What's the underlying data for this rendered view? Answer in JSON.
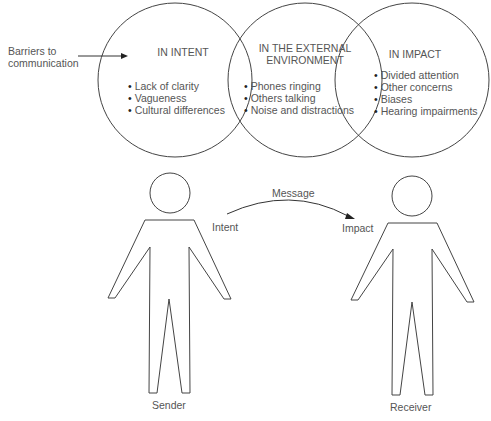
{
  "barriers_label": "Barriers to\ncommunication",
  "circles": [
    {
      "title": "IN INTENT",
      "items": [
        "Lack of clarity",
        "Vagueness",
        "Cultural differences"
      ]
    },
    {
      "title": "IN THE EXTERNAL ENVIRONMENT",
      "title_line1": "IN THE EXTERNAL",
      "title_line2": "ENVIRONMENT",
      "items": [
        "Phones ringing",
        "Others talking",
        "Noise and distractions"
      ]
    },
    {
      "title": "IN IMPACT",
      "items": [
        "Divided attention",
        "Other concerns",
        "Biases",
        "Hearing impairments"
      ]
    }
  ],
  "flow": {
    "message_label": "Message",
    "intent_label": "Intent",
    "impact_label": "Impact"
  },
  "figures": {
    "sender_label": "Sender",
    "receiver_label": "Receiver"
  },
  "colors": {
    "line": "#444444",
    "text": "#555555"
  }
}
